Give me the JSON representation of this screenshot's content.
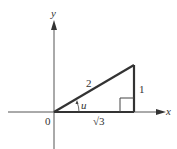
{
  "diagram": {
    "type": "right-triangle-on-axes",
    "axes": {
      "x_label": "x",
      "y_label": "y",
      "origin_label": "0"
    },
    "triangle": {
      "hypotenuse_label": "2",
      "opposite_label": "1",
      "adjacent_label": "√3",
      "angle_label": "u",
      "right_angle_marker": true
    },
    "colors": {
      "triangle_stroke": "#333333",
      "axis_stroke": "#555555",
      "background": "#ffffff"
    }
  }
}
